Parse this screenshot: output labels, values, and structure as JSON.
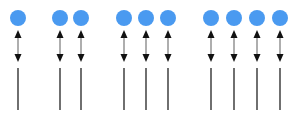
{
  "diagram": {
    "colors": {
      "circle": "#4a9af0",
      "arrow_head": "#111111",
      "arrow_shaft": "#9a9a9a",
      "line": "#333333",
      "background": "#ffffff"
    },
    "geometry": {
      "circle_cy": 18,
      "circle_r": 8,
      "arrow_top": 30,
      "arrow_bottom": 62,
      "line_top": 68,
      "line_bottom": 110
    },
    "groups": [
      {
        "name": "group-1",
        "count": 1,
        "x": [
          18
        ]
      },
      {
        "name": "group-2",
        "count": 2,
        "x": [
          60,
          81
        ]
      },
      {
        "name": "group-3",
        "count": 3,
        "x": [
          124,
          146,
          168
        ]
      },
      {
        "name": "group-4",
        "count": 4,
        "x": [
          211,
          234,
          257,
          280
        ]
      }
    ]
  }
}
